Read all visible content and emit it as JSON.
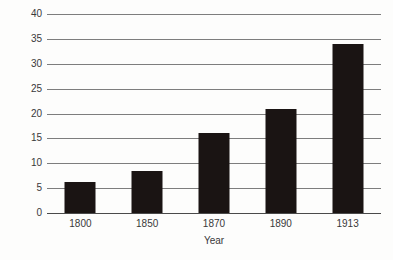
{
  "chart_data": {
    "type": "bar",
    "title": "",
    "subtitle": "",
    "xlabel": "Year",
    "ylabel": "",
    "categories": [
      "1800",
      "1850",
      "1870",
      "1890",
      "1913"
    ],
    "values": [
      6.3,
      8.5,
      16,
      21,
      34
    ],
    "ylim": [
      0,
      40
    ],
    "ytick_step": 5,
    "yticks": [
      "0",
      "5",
      "10",
      "15",
      "20",
      "25",
      "30",
      "35",
      "40"
    ],
    "ytick_values": [
      0,
      5,
      10,
      15,
      20,
      25,
      30,
      35,
      40
    ],
    "grid": true,
    "grid_axis": "y",
    "legend": false,
    "legend_position": "none",
    "series": [
      {
        "name": "",
        "values": [
          6.3,
          8.5,
          16,
          21,
          34
        ]
      }
    ],
    "annotations": [],
    "colors": {
      "bar": "#1a1413",
      "grid": "#7d7d7d",
      "axis": "#4a4a4a",
      "text": "#39393a",
      "background": "#fdfdfc"
    }
  }
}
